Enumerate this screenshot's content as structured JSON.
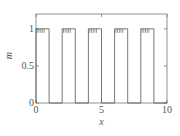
{
  "chart_data": {
    "type": "line",
    "title": "",
    "xlabel": "x",
    "ylabel": "m",
    "xlim": [
      0,
      10
    ],
    "ylim": [
      0,
      1.2
    ],
    "xticks": [
      0,
      5,
      10
    ],
    "yticks": [
      0,
      0.5,
      1
    ],
    "xtick_labels": [
      "0",
      "5",
      "10"
    ],
    "ytick_labels": [
      "0",
      "0.5",
      "1"
    ],
    "grid": false,
    "legend": null,
    "series": [
      {
        "name": "m(x)",
        "description": "Square pulse train: m=1 on [0,1],[2,3],[4,5],[6,7],[8,9], else 0, with small ripple spikes at top of each pulse",
        "x": [
          0,
          0,
          1,
          1,
          2,
          2,
          3,
          3,
          4,
          4,
          5,
          5,
          6,
          6,
          7,
          7,
          8,
          8,
          9,
          9,
          10
        ],
        "values": [
          0,
          1,
          1,
          0,
          0,
          1,
          1,
          0,
          0,
          1,
          1,
          0,
          0,
          1,
          1,
          0,
          0,
          1,
          1,
          0,
          0
        ]
      }
    ],
    "pulses": [
      [
        0,
        1
      ],
      [
        2,
        3
      ],
      [
        4,
        5
      ],
      [
        6,
        7
      ],
      [
        8,
        9
      ]
    ],
    "pulse_height": 1
  },
  "labels": {
    "x_axis": "x",
    "y_axis": "m",
    "x_ticks": [
      "0",
      "5",
      "10"
    ],
    "y_ticks": [
      "0",
      "0.5",
      "1"
    ]
  }
}
